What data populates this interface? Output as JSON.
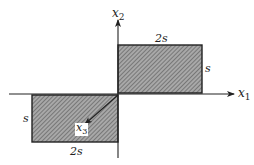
{
  "diagram": {
    "axes": {
      "x1": {
        "label": "x",
        "subscript": "1"
      },
      "x2": {
        "label": "x",
        "subscript": "2"
      },
      "x3": {
        "label": "x",
        "subscript": "3"
      }
    },
    "upper_rect": {
      "width_label": "2s",
      "height_label": "s"
    },
    "lower_rect": {
      "width_label": "2s",
      "height_label": "s"
    },
    "colors": {
      "line": "#222222",
      "fill": "#9a9a9a",
      "hatch": "#555555",
      "background": "#ffffff"
    }
  }
}
